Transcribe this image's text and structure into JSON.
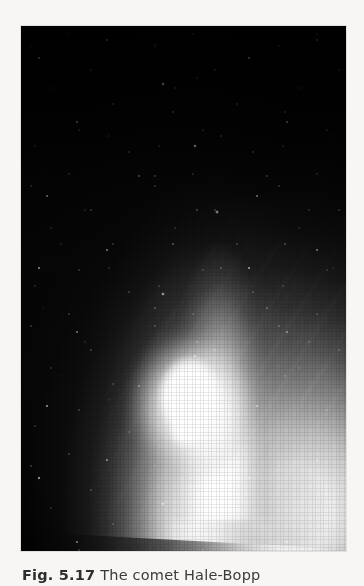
{
  "page": {
    "background_color": "#f7f6f4"
  },
  "figure": {
    "photo": {
      "alt_name": "comet-hale-bopp-photograph",
      "background_color": "#000000",
      "description": "Black-and-white astronomical photograph of comet Hale-Bopp showing a brilliant white coma near the bottom centre, a broad diffuse dust tail flaring upward and widening toward the top of the frame, fainter straight ion-tail streaks angled toward the upper left, and a scattering of white stars across a black sky.",
      "features": {
        "coma_label": "coma",
        "dust_tail_label": "dust tail",
        "ion_tail_label": "ion tail",
        "star_field_label": "star field"
      }
    },
    "caption": {
      "figure_label": "Fig. 5.17",
      "text": "The comet Hale-Bopp"
    }
  }
}
